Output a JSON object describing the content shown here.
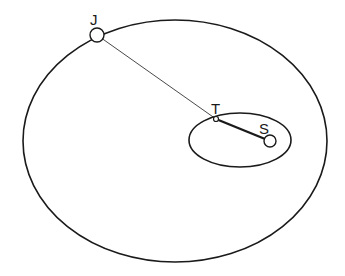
{
  "diagram": {
    "labels": {
      "jupiter": "J",
      "earth": "T",
      "sun": "S"
    },
    "colors": {
      "stroke": "#1a1a1a",
      "background": "#ffffff",
      "node_fill": "#ffffff"
    }
  }
}
